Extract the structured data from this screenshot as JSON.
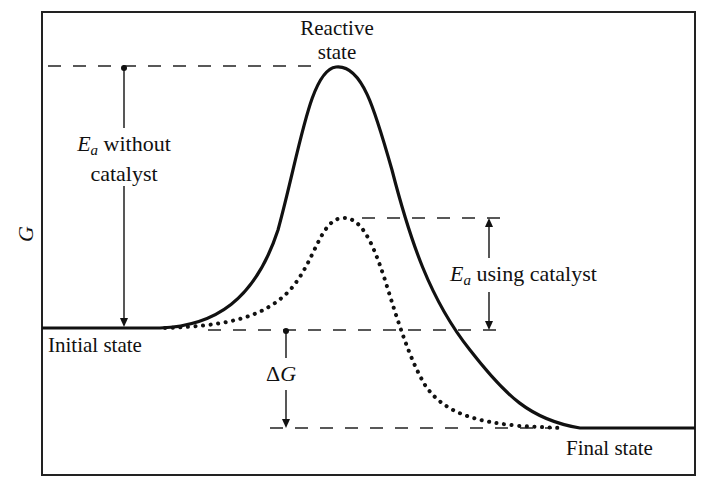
{
  "diagram": {
    "axis": {
      "ylabel": "G"
    },
    "labels": {
      "reactive_state_line1": "Reactive",
      "reactive_state_line2": "state",
      "ea_without_symbol": "E",
      "ea_without_subscript": "a",
      "ea_without_line1_rest": " without",
      "ea_without_line2": "catalyst",
      "ea_using_symbol": "E",
      "ea_using_subscript": "a",
      "ea_using_rest": " using catalyst",
      "initial_state": "Initial state",
      "final_state": "Final state",
      "delta_g_prefix": "Δ",
      "delta_g_symbol": "G"
    },
    "curves": [
      {
        "name": "without catalyst",
        "style": "solid"
      },
      {
        "name": "using catalyst",
        "style": "dotted"
      }
    ],
    "colors": {
      "line": "#111111",
      "background": "#ffffff"
    }
  }
}
